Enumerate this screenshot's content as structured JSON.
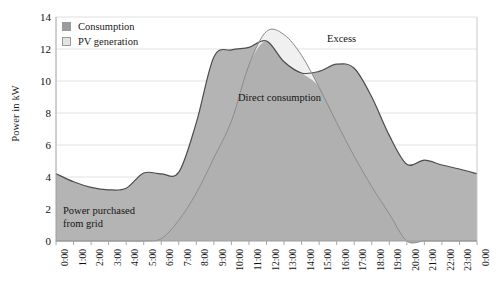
{
  "chart_data": {
    "type": "area",
    "title": "",
    "xlabel": "",
    "ylabel": "Power in kW",
    "ylim": [
      0,
      14
    ],
    "ytick_step": 2,
    "yticks": [
      "14",
      "12",
      "10",
      "8",
      "6",
      "4",
      "2",
      "0"
    ],
    "grid": true,
    "grid_axis": "y",
    "legend_position": "top-left",
    "x": [
      "0:00",
      "1:00",
      "2:00",
      "3:00",
      "4:00",
      "5:00",
      "6:00",
      "7:00",
      "8:00",
      "9:00",
      "10:00",
      "11:00",
      "12:00",
      "13:00",
      "14:00",
      "15:00",
      "16:00",
      "17:00",
      "18:00",
      "19:00",
      "20:00",
      "21:00",
      "22:00",
      "23:00",
      "0:00"
    ],
    "series": [
      {
        "name": "Consumption",
        "color": "#b4b4b4",
        "line_color": "#4d4d4d",
        "values": [
          4.2,
          3.7,
          3.35,
          3.2,
          3.3,
          4.25,
          4.2,
          4.3,
          7.4,
          11.5,
          11.95,
          12.1,
          12.5,
          11.2,
          10.5,
          10.6,
          11.05,
          10.8,
          9.0,
          6.6,
          4.8,
          5.05,
          4.75,
          4.5,
          4.2
        ]
      },
      {
        "name": "PV generation",
        "color": "#efefef",
        "line_color": "#7d7d7d",
        "values": [
          0,
          0,
          0,
          0,
          0,
          0,
          0.15,
          1.3,
          3.0,
          5.2,
          7.5,
          11.0,
          13.1,
          12.9,
          11.6,
          9.6,
          7.4,
          5.3,
          3.4,
          1.7,
          0.0,
          0,
          0,
          0,
          0
        ]
      }
    ],
    "annotations": [
      {
        "id": "power-purchased",
        "text": "Power purchased\nfrom grid",
        "line1": "Power purchased",
        "line2": "from grid"
      },
      {
        "id": "direct-consumption",
        "text": "Direct consumption"
      },
      {
        "id": "excess",
        "text": "Excess"
      }
    ]
  },
  "legend": {
    "items": [
      {
        "label": "Consumption",
        "swatch": "consumption"
      },
      {
        "label": "PV generation",
        "swatch": "pv"
      }
    ]
  },
  "annotations": {
    "power_purchased_line1": "Power purchased",
    "power_purchased_line2": "from grid",
    "direct_consumption": "Direct consumption",
    "excess": "Excess"
  },
  "axes": {
    "y_title": "Power in kW",
    "y_ticks": [
      "14",
      "12",
      "10",
      "8",
      "6",
      "4",
      "2",
      "0"
    ],
    "x_ticks": [
      "0:00",
      "1:00",
      "2:00",
      "3:00",
      "4:00",
      "5:00",
      "6:00",
      "7:00",
      "8:00",
      "9:00",
      "10:00",
      "11:00",
      "12:00",
      "13:00",
      "14:00",
      "15:00",
      "16:00",
      "17:00",
      "18:00",
      "19:00",
      "20:00",
      "21:00",
      "22:00",
      "23:00",
      "0:00"
    ]
  },
  "colors": {
    "consumption_fill": "#b4b4b4",
    "pv_fill": "#efefef",
    "grid_purchase_fill": "#a8a8a8",
    "axis": "#b0b0b0",
    "text": "#111111"
  }
}
